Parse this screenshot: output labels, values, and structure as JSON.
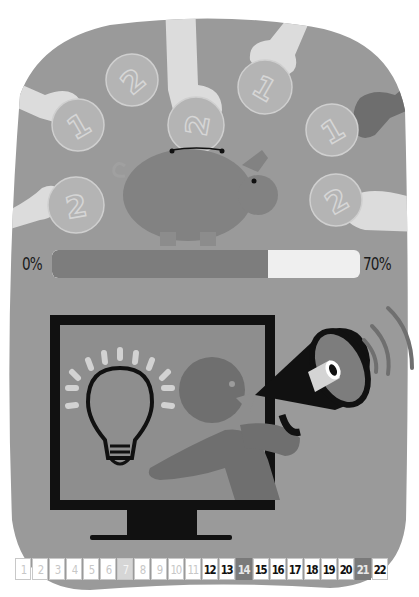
{
  "illustration": {
    "top_scene": "piggy-bank-with-coins",
    "bottom_scene": "monitor-announcement-megaphone",
    "coins": [
      {
        "value": "2",
        "position": "upper-left"
      },
      {
        "value": "1",
        "position": "left"
      },
      {
        "value": "2",
        "position": "center-top"
      },
      {
        "value": "1",
        "position": "upper-right"
      },
      {
        "value": "1",
        "position": "right"
      },
      {
        "value": "2",
        "position": "lower-left"
      },
      {
        "value": "2",
        "position": "lower-right"
      }
    ],
    "colors": {
      "background_shape": "#9a9a9a",
      "pig": "#828282",
      "coin": "#b4b4b4",
      "hand_light": "#dcdcdc",
      "hand_dark": "#6e6e6e",
      "monitor": "#111111",
      "screen": "#8e8e8e",
      "person": "#6f6f6f"
    }
  },
  "progress": {
    "min_label": "0%",
    "max_label": "70%",
    "fill_percent": 70,
    "fill_color": "#7d7d7d",
    "track_color": "#efefef"
  },
  "calendar": {
    "days": [
      {
        "n": "1",
        "state": "past"
      },
      {
        "n": "2",
        "state": "past"
      },
      {
        "n": "3",
        "state": "past"
      },
      {
        "n": "4",
        "state": "past"
      },
      {
        "n": "5",
        "state": "past"
      },
      {
        "n": "6",
        "state": "past"
      },
      {
        "n": "7",
        "state": "past-hl"
      },
      {
        "n": "8",
        "state": "past"
      },
      {
        "n": "9",
        "state": "past"
      },
      {
        "n": "10",
        "state": "past"
      },
      {
        "n": "11",
        "state": "past"
      },
      {
        "n": "12",
        "state": "upcoming"
      },
      {
        "n": "13",
        "state": "upcoming"
      },
      {
        "n": "14",
        "state": "hl"
      },
      {
        "n": "15",
        "state": "upcoming"
      },
      {
        "n": "16",
        "state": "upcoming"
      },
      {
        "n": "17",
        "state": "upcoming"
      },
      {
        "n": "18",
        "state": "upcoming"
      },
      {
        "n": "19",
        "state": "upcoming"
      },
      {
        "n": "20",
        "state": "upcoming"
      },
      {
        "n": "21",
        "state": "hl"
      },
      {
        "n": "22",
        "state": "upcoming"
      }
    ]
  }
}
